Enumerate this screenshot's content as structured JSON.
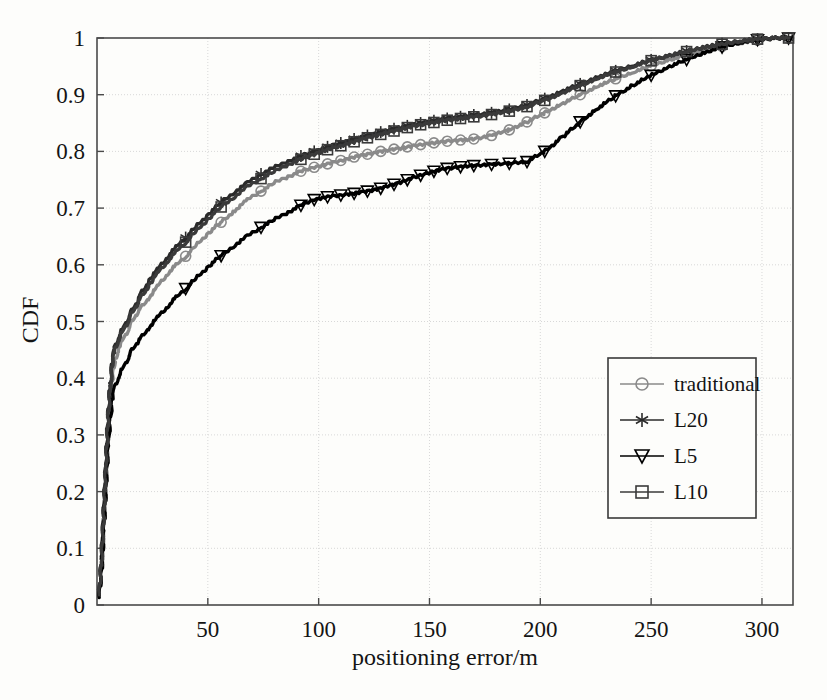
{
  "chart_data": {
    "type": "line",
    "title": "",
    "subtitle": "",
    "xlabel": "positioning error/m",
    "ylabel": "CDF",
    "xlim": [
      0,
      314
    ],
    "ylim": [
      0,
      1
    ],
    "xticks": [
      50,
      100,
      150,
      200,
      250,
      300
    ],
    "xtick_labels": [
      "50",
      "100",
      "150",
      "200",
      "250",
      "300"
    ],
    "yticks": [
      0,
      0.1,
      0.2,
      0.3,
      0.4,
      0.5,
      0.6,
      0.7,
      0.8,
      0.9,
      1
    ],
    "ytick_labels": [
      "0",
      "0.1",
      "0.2",
      "0.3",
      "0.4",
      "0.5",
      "0.6",
      "0.7",
      "0.8",
      "0.9",
      "1"
    ],
    "grid": true,
    "legend_position": "lower-right",
    "series": [
      {
        "name": "traditional",
        "marker": "circle",
        "color": "#8a8a8a",
        "x": [
          1,
          2,
          3,
          4,
          5,
          6,
          7,
          8,
          10,
          12,
          14,
          16,
          18,
          20,
          24,
          28,
          32,
          36,
          40,
          45,
          50,
          56,
          62,
          68,
          74,
          80,
          86,
          92,
          98,
          104,
          110,
          116,
          122,
          128,
          134,
          140,
          146,
          152,
          158,
          164,
          170,
          178,
          186,
          194,
          202,
          210,
          218,
          226,
          234,
          242,
          250,
          258,
          266,
          274,
          282,
          290,
          298,
          306,
          312
        ],
        "y": [
          0.02,
          0.07,
          0.14,
          0.22,
          0.3,
          0.36,
          0.4,
          0.43,
          0.455,
          0.47,
          0.485,
          0.5,
          0.515,
          0.525,
          0.545,
          0.565,
          0.585,
          0.6,
          0.615,
          0.635,
          0.655,
          0.675,
          0.695,
          0.715,
          0.73,
          0.745,
          0.755,
          0.765,
          0.772,
          0.778,
          0.784,
          0.79,
          0.795,
          0.8,
          0.804,
          0.808,
          0.812,
          0.815,
          0.818,
          0.82,
          0.822,
          0.828,
          0.838,
          0.852,
          0.868,
          0.884,
          0.9,
          0.915,
          0.928,
          0.94,
          0.951,
          0.961,
          0.97,
          0.978,
          0.985,
          0.991,
          0.996,
          0.999,
          1.0
        ]
      },
      {
        "name": "L20",
        "marker": "asterisk",
        "color": "#2a2a2a",
        "x": [
          1,
          2,
          3,
          4,
          5,
          6,
          7,
          8,
          10,
          12,
          14,
          16,
          18,
          20,
          24,
          28,
          32,
          36,
          40,
          45,
          50,
          56,
          62,
          68,
          74,
          80,
          86,
          92,
          98,
          104,
          110,
          116,
          122,
          128,
          134,
          140,
          146,
          152,
          158,
          164,
          170,
          178,
          186,
          194,
          202,
          210,
          218,
          226,
          234,
          242,
          250,
          258,
          266,
          274,
          282,
          290,
          298,
          306,
          312
        ],
        "y": [
          0.02,
          0.08,
          0.16,
          0.25,
          0.33,
          0.39,
          0.43,
          0.455,
          0.475,
          0.49,
          0.505,
          0.52,
          0.535,
          0.55,
          0.575,
          0.595,
          0.615,
          0.632,
          0.648,
          0.668,
          0.688,
          0.71,
          0.728,
          0.745,
          0.76,
          0.772,
          0.782,
          0.792,
          0.8,
          0.808,
          0.815,
          0.822,
          0.828,
          0.834,
          0.84,
          0.845,
          0.85,
          0.854,
          0.858,
          0.861,
          0.864,
          0.868,
          0.874,
          0.882,
          0.893,
          0.906,
          0.919,
          0.931,
          0.942,
          0.952,
          0.961,
          0.969,
          0.977,
          0.984,
          0.99,
          0.995,
          0.998,
          1.0,
          1.0
        ]
      },
      {
        "name": "L5",
        "marker": "triangle-down",
        "color": "#000000",
        "x": [
          1,
          2,
          3,
          4,
          5,
          6,
          7,
          8,
          10,
          12,
          14,
          16,
          18,
          20,
          24,
          28,
          32,
          36,
          40,
          45,
          50,
          56,
          62,
          68,
          74,
          80,
          86,
          92,
          98,
          104,
          110,
          116,
          122,
          128,
          134,
          140,
          146,
          152,
          158,
          164,
          170,
          178,
          186,
          194,
          202,
          210,
          218,
          226,
          234,
          242,
          250,
          258,
          266,
          274,
          282,
          290,
          298,
          306,
          312
        ],
        "y": [
          0.015,
          0.06,
          0.13,
          0.21,
          0.28,
          0.33,
          0.365,
          0.385,
          0.405,
          0.42,
          0.435,
          0.45,
          0.462,
          0.472,
          0.492,
          0.51,
          0.527,
          0.543,
          0.558,
          0.577,
          0.596,
          0.616,
          0.634,
          0.651,
          0.666,
          0.68,
          0.692,
          0.705,
          0.715,
          0.72,
          0.723,
          0.726,
          0.73,
          0.735,
          0.742,
          0.75,
          0.758,
          0.765,
          0.77,
          0.773,
          0.775,
          0.777,
          0.779,
          0.782,
          0.8,
          0.825,
          0.852,
          0.876,
          0.898,
          0.917,
          0.934,
          0.949,
          0.962,
          0.974,
          0.984,
          0.992,
          0.997,
          1.0,
          1.0
        ]
      },
      {
        "name": "L10",
        "marker": "square",
        "color": "#3a3a3a",
        "x": [
          1,
          2,
          3,
          4,
          5,
          6,
          7,
          8,
          10,
          12,
          14,
          16,
          18,
          20,
          24,
          28,
          32,
          36,
          40,
          45,
          50,
          56,
          62,
          68,
          74,
          80,
          86,
          92,
          98,
          104,
          110,
          116,
          122,
          128,
          134,
          140,
          146,
          152,
          158,
          164,
          170,
          178,
          186,
          194,
          202,
          210,
          218,
          226,
          234,
          242,
          250,
          258,
          266,
          274,
          282,
          290,
          298,
          306,
          312
        ],
        "y": [
          0.02,
          0.075,
          0.155,
          0.245,
          0.325,
          0.385,
          0.425,
          0.45,
          0.47,
          0.485,
          0.5,
          0.515,
          0.53,
          0.543,
          0.567,
          0.588,
          0.607,
          0.624,
          0.64,
          0.66,
          0.68,
          0.702,
          0.72,
          0.738,
          0.752,
          0.765,
          0.776,
          0.786,
          0.795,
          0.803,
          0.81,
          0.817,
          0.824,
          0.83,
          0.836,
          0.842,
          0.847,
          0.851,
          0.855,
          0.858,
          0.861,
          0.865,
          0.871,
          0.879,
          0.89,
          0.903,
          0.916,
          0.929,
          0.94,
          0.95,
          0.96,
          0.968,
          0.976,
          0.983,
          0.989,
          0.994,
          0.998,
          1.0,
          1.0
        ]
      }
    ]
  },
  "legend": {
    "entries": [
      {
        "label": "traditional",
        "marker": "circle-icon"
      },
      {
        "label": "L20",
        "marker": "asterisk-icon"
      },
      {
        "label": "L5",
        "marker": "triangle-down-icon"
      },
      {
        "label": "L10",
        "marker": "square-icon"
      }
    ]
  },
  "axes": {
    "x_title": "positioning error/m",
    "y_title": "CDF"
  },
  "colors": {
    "background": "#fdfdfb",
    "frame": "#4a4a4a",
    "grid": "#d8d8d8",
    "traditional": "#8a8a8a",
    "l20": "#2a2a2a",
    "l5": "#000000",
    "l10": "#3a3a3a"
  }
}
